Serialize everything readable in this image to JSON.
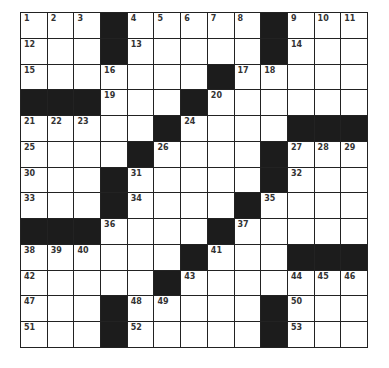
{
  "puzzle": {
    "rows": 13,
    "cols": 13,
    "grid": [
      [
        "1",
        "2",
        "3",
        "#",
        "4",
        "5",
        "6",
        "7",
        "8",
        "#",
        "9",
        "10",
        "11"
      ],
      [
        "12",
        "",
        "",
        "#",
        "13",
        "",
        "",
        "",
        "",
        "#",
        "14",
        "",
        ""
      ],
      [
        "15",
        "",
        "",
        "16",
        "",
        "",
        "",
        "#",
        "17",
        "18",
        "",
        "",
        ""
      ],
      [
        "#",
        "#",
        "#",
        "19",
        "",
        "",
        "#",
        "20",
        "",
        "",
        "",
        "",
        ""
      ],
      [
        "21",
        "22",
        "23",
        "",
        "",
        "#",
        "24",
        "",
        "",
        "",
        "#",
        "#",
        "#"
      ],
      [
        "25",
        "",
        "",
        "",
        "#",
        "26",
        "",
        "",
        "",
        "#",
        "27",
        "28",
        "29"
      ],
      [
        "30",
        "",
        "",
        "#",
        "31",
        "",
        "",
        "",
        "",
        "#",
        "32",
        "",
        ""
      ],
      [
        "33",
        "",
        "",
        "#",
        "34",
        "",
        "",
        "",
        "#",
        "35",
        "",
        "",
        ""
      ],
      [
        "#",
        "#",
        "#",
        "36",
        "",
        "",
        "",
        "#",
        "37",
        "",
        "",
        "",
        ""
      ],
      [
        "38",
        "39",
        "40",
        "",
        "",
        "",
        "#",
        "41",
        "",
        "",
        "#",
        "#",
        "#"
      ],
      [
        "42",
        "",
        "",
        "",
        "",
        "#",
        "43",
        "",
        "",
        "",
        "44",
        "45",
        "46"
      ],
      [
        "47",
        "",
        "",
        "#",
        "48",
        "49",
        "",
        "",
        "",
        "#",
        "50",
        "",
        ""
      ],
      [
        "51",
        "",
        "",
        "#",
        "52",
        "",
        "",
        "",
        "",
        "#",
        "53",
        "",
        ""
      ]
    ]
  },
  "colors": {
    "block": "#1c1c1c",
    "cell": "#ffffff",
    "line": "#222222"
  }
}
